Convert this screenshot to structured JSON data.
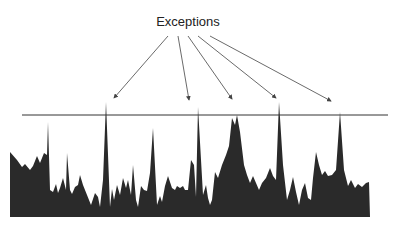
{
  "label": "Exceptions",
  "colors": {
    "fill": "#2a2a2a",
    "line": "#333333",
    "arrow": "#444444"
  },
  "threshold_y": 115,
  "baseline_y": 217,
  "area_points": [
    [
      10,
      152
    ],
    [
      17,
      160
    ],
    [
      22,
      167
    ],
    [
      25,
      164
    ],
    [
      30,
      170
    ],
    [
      33,
      166
    ],
    [
      37,
      156
    ],
    [
      40,
      163
    ],
    [
      44,
      153
    ],
    [
      47,
      155
    ],
    [
      48,
      122
    ],
    [
      50,
      190
    ],
    [
      53,
      192
    ],
    [
      56,
      184
    ],
    [
      58,
      193
    ],
    [
      60,
      188
    ],
    [
      63,
      178
    ],
    [
      66,
      190
    ],
    [
      67,
      153
    ],
    [
      70,
      190
    ],
    [
      72,
      194
    ],
    [
      75,
      187
    ],
    [
      78,
      185
    ],
    [
      80,
      175
    ],
    [
      83,
      185
    ],
    [
      87,
      195
    ],
    [
      91,
      205
    ],
    [
      95,
      193
    ],
    [
      98,
      197
    ],
    [
      100,
      207
    ],
    [
      103,
      180
    ],
    [
      106,
      102
    ],
    [
      110,
      207
    ],
    [
      112,
      189
    ],
    [
      114,
      200
    ],
    [
      117,
      185
    ],
    [
      120,
      195
    ],
    [
      123,
      178
    ],
    [
      126,
      188
    ],
    [
      128,
      180
    ],
    [
      131,
      195
    ],
    [
      133,
      165
    ],
    [
      136,
      200
    ],
    [
      138,
      207
    ],
    [
      141,
      186
    ],
    [
      144,
      190
    ],
    [
      147,
      191
    ],
    [
      150,
      173
    ],
    [
      153,
      128
    ],
    [
      157,
      205
    ],
    [
      160,
      196
    ],
    [
      162,
      202
    ],
    [
      165,
      186
    ],
    [
      168,
      176
    ],
    [
      172,
      188
    ],
    [
      175,
      190
    ],
    [
      177,
      186
    ],
    [
      180,
      188
    ],
    [
      183,
      186
    ],
    [
      185,
      190
    ],
    [
      188,
      190
    ],
    [
      191,
      160
    ],
    [
      194,
      165
    ],
    [
      196,
      197
    ],
    [
      198,
      107
    ],
    [
      203,
      195
    ],
    [
      206,
      185
    ],
    [
      208,
      198
    ],
    [
      210,
      205
    ],
    [
      212,
      200
    ],
    [
      215,
      172
    ],
    [
      218,
      178
    ],
    [
      222,
      165
    ],
    [
      226,
      155
    ],
    [
      229,
      146
    ],
    [
      232,
      118
    ],
    [
      235,
      125
    ],
    [
      237,
      115
    ],
    [
      240,
      132
    ],
    [
      244,
      165
    ],
    [
      247,
      175
    ],
    [
      250,
      183
    ],
    [
      253,
      176
    ],
    [
      256,
      183
    ],
    [
      259,
      190
    ],
    [
      262,
      183
    ],
    [
      266,
      178
    ],
    [
      270,
      168
    ],
    [
      273,
      176
    ],
    [
      276,
      180
    ],
    [
      279,
      102
    ],
    [
      283,
      165
    ],
    [
      287,
      200
    ],
    [
      290,
      190
    ],
    [
      293,
      177
    ],
    [
      296,
      192
    ],
    [
      299,
      205
    ],
    [
      302,
      190
    ],
    [
      305,
      183
    ],
    [
      308,
      198
    ],
    [
      311,
      200
    ],
    [
      313,
      178
    ],
    [
      316,
      152
    ],
    [
      319,
      165
    ],
    [
      322,
      175
    ],
    [
      325,
      171
    ],
    [
      328,
      176
    ],
    [
      332,
      175
    ],
    [
      336,
      170
    ],
    [
      340,
      112
    ],
    [
      344,
      170
    ],
    [
      348,
      186
    ],
    [
      351,
      180
    ],
    [
      355,
      188
    ],
    [
      358,
      184
    ],
    [
      362,
      187
    ],
    [
      366,
      183
    ],
    [
      369,
      182
    ],
    [
      370,
      217
    ],
    [
      10,
      217
    ]
  ],
  "threshold_line": {
    "x1": 22,
    "x2": 388
  },
  "arrows": [
    {
      "x1": 168,
      "y1": 36,
      "x2": 114,
      "y2": 98
    },
    {
      "x1": 178,
      "y1": 36,
      "x2": 189,
      "y2": 100
    },
    {
      "x1": 188,
      "y1": 36,
      "x2": 232,
      "y2": 99
    },
    {
      "x1": 198,
      "y1": 36,
      "x2": 276,
      "y2": 98
    },
    {
      "x1": 210,
      "y1": 36,
      "x2": 331,
      "y2": 101
    }
  ]
}
